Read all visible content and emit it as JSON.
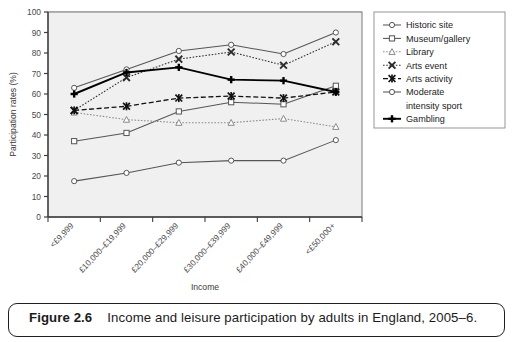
{
  "figure": {
    "caption_number": "Figure 2.6",
    "caption_text": "Income and leisure participation by adults in England, 2005–6."
  },
  "chart_data": {
    "type": "line",
    "title": "",
    "xlabel": "Income",
    "ylabel": "Participation rates (%)",
    "ylim": [
      0,
      100
    ],
    "yticks": [
      0,
      10,
      20,
      30,
      40,
      50,
      60,
      70,
      80,
      90,
      100
    ],
    "grid": true,
    "legend_position": "right",
    "categories": [
      "<£9,999",
      "£10,000–£19,999",
      "£20,000–£29,999",
      "£30,000–£39,999",
      "£40,000–£49,999",
      "<£50,000+"
    ],
    "series": [
      {
        "name": "Historic site",
        "marker": "circle",
        "dash": "solid",
        "color": "#555555",
        "values": [
          63,
          72,
          81,
          84,
          79.5,
          90
        ]
      },
      {
        "name": "Museum/gallery",
        "marker": "square",
        "dash": "solid",
        "color": "#555555",
        "values": [
          37,
          41,
          51.5,
          56,
          55,
          64
        ]
      },
      {
        "name": "Library",
        "marker": "triangle",
        "dash": "dotted",
        "color": "#8a8a8a",
        "values": [
          51,
          47.5,
          46,
          46,
          48,
          44
        ]
      },
      {
        "name": "Arts event",
        "marker": "cross-x",
        "dash": "dotted",
        "color": "#2b2b2b",
        "values": [
          52,
          68,
          77,
          80.5,
          74,
          85.5
        ]
      },
      {
        "name": "Arts activity",
        "marker": "asterisk",
        "dash": "dashed",
        "color": "#111111",
        "values": [
          52,
          54,
          58,
          59,
          58,
          61
        ]
      },
      {
        "name": "Moderate intensity sport",
        "marker": "circle",
        "dash": "solid",
        "color": "#555555",
        "values": [
          17.5,
          21.5,
          26.5,
          27.5,
          27.5,
          37.5
        ]
      },
      {
        "name": "Gambling",
        "marker": "plus",
        "dash": "solid",
        "color": "#000000",
        "values": [
          60,
          70.5,
          73,
          67,
          66.5,
          61
        ]
      }
    ]
  },
  "legend": {
    "items": [
      {
        "label": "Historic site"
      },
      {
        "label": "Museum/gallery"
      },
      {
        "label": "Library"
      },
      {
        "label": "Arts event"
      },
      {
        "label": "Arts activity"
      },
      {
        "label": "Moderate"
      },
      {
        "label": "intensity sport"
      },
      {
        "label": "Gambling"
      }
    ]
  }
}
